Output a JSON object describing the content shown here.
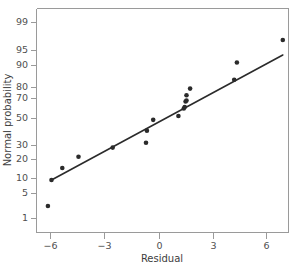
{
  "chart_data": {
    "type": "scatter",
    "title": "",
    "xlabel": "Residual",
    "ylabel": "Normal probability",
    "xlim": [
      -7.6,
      7.6
    ],
    "ylim_probability": [
      0.6,
      99.6
    ],
    "xticks": [
      -6,
      -3,
      0,
      3,
      6
    ],
    "xticklabels": [
      "−6",
      "−3",
      "0",
      "3",
      "6"
    ],
    "yticks": [
      1,
      5,
      10,
      20,
      30,
      50,
      70,
      80,
      90,
      95,
      99
    ],
    "yticklabels": [
      "1",
      "5",
      "10",
      "20",
      "30",
      "50",
      "70",
      "80",
      "90",
      "95",
      "99"
    ],
    "grid": false,
    "legend": null,
    "scale": "normal-probability",
    "points": [
      {
        "x": -6.2,
        "y": 3.0
      },
      {
        "x": -6.0,
        "y": 9.5
      },
      {
        "x": -5.4,
        "y": 15.5
      },
      {
        "x": -4.5,
        "y": 22.0
      },
      {
        "x": -2.6,
        "y": 28.5
      },
      {
        "x": -0.75,
        "y": 32.0
      },
      {
        "x": -0.7,
        "y": 41.0
      },
      {
        "x": -0.35,
        "y": 49.0
      },
      {
        "x": 1.05,
        "y": 52.5
      },
      {
        "x": 1.35,
        "y": 60.0
      },
      {
        "x": 1.4,
        "y": 61.5
      },
      {
        "x": 1.45,
        "y": 67.0
      },
      {
        "x": 1.5,
        "y": 68.0
      },
      {
        "x": 1.5,
        "y": 73.0
      },
      {
        "x": 1.7,
        "y": 79.0
      },
      {
        "x": 4.15,
        "y": 83.5
      },
      {
        "x": 4.3,
        "y": 91.0
      },
      {
        "x": 6.85,
        "y": 96.5
      }
    ],
    "reference_line": {
      "name": "normal-reference-line",
      "x_start": -6.0,
      "y_start": 9.5,
      "x_end": 6.85,
      "y_end": 93.5
    },
    "colors": {
      "point": "#2b2b2b",
      "line": "#2b2b2b",
      "axis": "#9a9a9a",
      "text": "#4a4a4a",
      "background": "#ffffff"
    }
  }
}
